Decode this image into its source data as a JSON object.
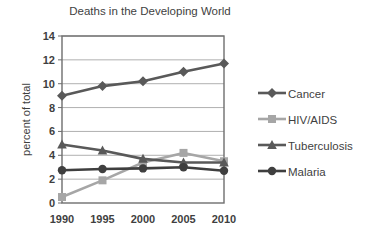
{
  "chart_data": {
    "type": "line",
    "title": "Deaths in the Developing World",
    "xlabel": "",
    "ylabel": "percent of total",
    "categories": [
      "1990",
      "1995",
      "2000",
      "2005",
      "2010"
    ],
    "x": [
      1990,
      1995,
      2000,
      2005,
      2010
    ],
    "ylim": [
      0,
      14
    ],
    "ytick_step": 2,
    "yticks": [
      "0",
      "2",
      "4",
      "6",
      "8",
      "10",
      "12",
      "14"
    ],
    "grid": "horizontal",
    "legend_position": "right",
    "series": [
      {
        "name": "Cancer",
        "marker": "diamond",
        "color": "#595959",
        "values": [
          9.0,
          9.8,
          10.2,
          11.0,
          11.7
        ]
      },
      {
        "name": "HIV/AIDS",
        "marker": "square",
        "color": "#a6a6a6",
        "values": [
          0.5,
          1.9,
          3.4,
          4.2,
          3.5
        ]
      },
      {
        "name": "Tuberculosis",
        "marker": "triangle",
        "color": "#595959",
        "values": [
          4.9,
          4.4,
          3.7,
          3.4,
          3.4
        ]
      },
      {
        "name": "Malaria",
        "marker": "circle",
        "color": "#3f3f3f",
        "values": [
          2.75,
          2.85,
          2.9,
          3.0,
          2.7
        ]
      }
    ]
  },
  "style": {
    "plot_border_color": "#6e6e6e",
    "gridline_color": "#b0b0b0",
    "background": "#ffffff",
    "text_color": "#3f3f3f"
  }
}
